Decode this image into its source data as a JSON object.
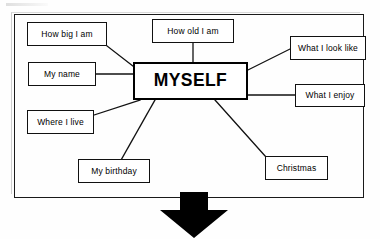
{
  "diagram": {
    "title": "MYSELF",
    "center": {
      "label": "MYSELF"
    },
    "nodes": [
      {
        "id": "how-big-i-am",
        "label": "How big I am"
      },
      {
        "id": "how-old-i-am",
        "label": "How old I am"
      },
      {
        "id": "what-i-look-like",
        "label": "What I look like"
      },
      {
        "id": "my-name",
        "label": "My name"
      },
      {
        "id": "what-i-enjoy",
        "label": "What I enjoy"
      },
      {
        "id": "where-i-live",
        "label": "Where I live"
      },
      {
        "id": "my-birthday",
        "label": "My birthday"
      },
      {
        "id": "christmas",
        "label": "Christmas"
      }
    ],
    "arrow": {
      "direction": "down"
    },
    "colors": {
      "line": "#111111",
      "text": "#000000",
      "background": "#ffffff",
      "arrow": "#000000"
    }
  }
}
